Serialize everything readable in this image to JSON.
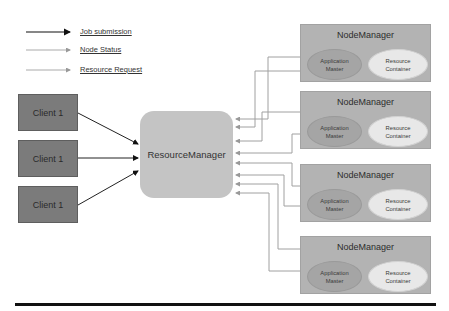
{
  "legend": {
    "items": [
      {
        "label": "Job submission",
        "line_color": "#111111",
        "style": "job-submission"
      },
      {
        "label": "Node Status",
        "line_color": "#9a9a9a",
        "style": "node-status"
      },
      {
        "label": "Resource Request",
        "line_color": "#9a9a9a",
        "style": "resource-request"
      }
    ]
  },
  "clients": [
    {
      "label": "Client 1"
    },
    {
      "label": "Client 1"
    },
    {
      "label": "Client 1"
    }
  ],
  "resource_manager": {
    "label": "ResourceManager"
  },
  "node_managers": [
    {
      "title": "NodeManager",
      "app_master": "Application Master",
      "resource_container": "Resource Container"
    },
    {
      "title": "NodeManager",
      "app_master": "Application Master",
      "resource_container": "Resource Container"
    },
    {
      "title": "NodeManager",
      "app_master": "Application Master",
      "resource_container": "Resource Container"
    },
    {
      "title": "NodeManager",
      "app_master": "Application Master",
      "resource_container": "Resource Container"
    }
  ],
  "colors": {
    "client_fill": "#7b7b7b",
    "resource_manager_fill": "#c4c4c4",
    "node_manager_fill": "#b3b3b3",
    "app_master_fill": "#a5a5a5",
    "resource_container_fill": "#e8e8e8",
    "job_arrow": "#111111",
    "status_arrow": "#9a9a9a"
  }
}
